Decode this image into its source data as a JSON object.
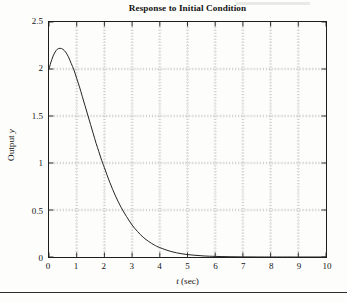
{
  "figure": {
    "title": "Response to Initial Condition",
    "page_rule": true,
    "smudge": true
  },
  "chart_data": {
    "type": "line",
    "title": "Response to Initial Condition",
    "xlabel": "t (sec)",
    "xlabel_italic_symbol": "t",
    "xlabel_unit": "(sec)",
    "ylabel": "Output y",
    "ylabel_text": "Output",
    "ylabel_italic_symbol": "y",
    "xlim": [
      0,
      10
    ],
    "ylim": [
      0,
      2.5
    ],
    "xticks": [
      0,
      1,
      2,
      3,
      4,
      5,
      6,
      7,
      8,
      9,
      10
    ],
    "xtick_labels": [
      "0",
      "1",
      "2",
      "3",
      "4",
      "5",
      "6",
      "7",
      "8",
      "9",
      "10"
    ],
    "yticks": [
      0,
      0.5,
      1,
      1.5,
      2,
      2.5
    ],
    "ytick_labels": [
      "0",
      "0.5",
      "1",
      "1.5",
      "2",
      "2.5"
    ],
    "grid": true,
    "grid_style": "dotted",
    "minor_ticks": true,
    "legend": null,
    "series": [
      {
        "name": "Output y",
        "color": "#222222",
        "line_width": 1.0,
        "x": [
          0,
          0.1,
          0.2,
          0.3,
          0.4,
          0.5,
          0.6,
          0.7,
          0.8,
          0.9,
          1.0,
          1.1,
          1.2,
          1.3,
          1.4,
          1.5,
          1.6,
          1.7,
          1.8,
          1.9,
          2.0,
          2.2,
          2.4,
          2.6,
          2.8,
          3.0,
          3.2,
          3.4,
          3.6,
          3.8,
          4.0,
          4.4,
          4.8,
          5.2,
          5.6,
          6.0,
          6.5,
          7.0,
          7.5,
          8.0,
          9.0,
          10.0
        ],
        "values": [
          2.0,
          2.1,
          2.17,
          2.21,
          2.22,
          2.21,
          2.18,
          2.13,
          2.06,
          1.99,
          1.9,
          1.81,
          1.71,
          1.61,
          1.51,
          1.41,
          1.31,
          1.21,
          1.12,
          1.03,
          0.95,
          0.79,
          0.65,
          0.53,
          0.43,
          0.34,
          0.27,
          0.21,
          0.165,
          0.128,
          0.1,
          0.059,
          0.034,
          0.02,
          0.011,
          0.0065,
          0.0031,
          0.0015,
          0.0007,
          0.0004,
          0.0001,
          0.0
        ]
      }
    ]
  }
}
